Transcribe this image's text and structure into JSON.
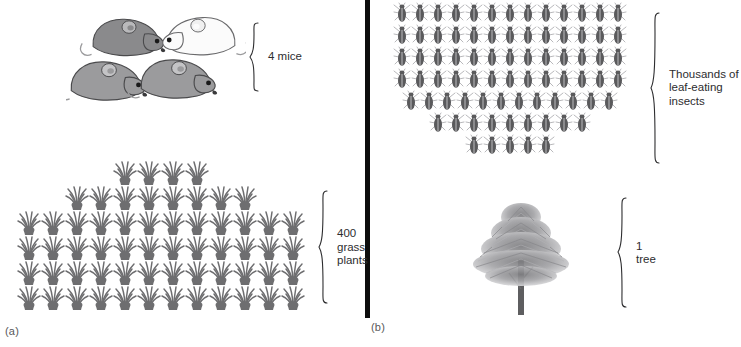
{
  "figure": {
    "panels": [
      {
        "id": "a",
        "caption": "(a)"
      },
      {
        "id": "b",
        "caption": "(b)"
      }
    ]
  },
  "panel_a": {
    "caption": "(a)",
    "levels": [
      {
        "name": "mice",
        "label": "4 mice",
        "count": 4,
        "icon": "mouse-icon",
        "icon_rows": [
          4
        ],
        "colors": [
          "#8c8c8c",
          "#8c8c8c",
          "#f2f2f2",
          "#8c8c8c"
        ]
      },
      {
        "name": "grass-plants",
        "label": "400\ngrass\nplants",
        "count": 400,
        "icon": "grass-tuft-icon",
        "icon_rows": [
          4,
          8,
          12,
          12,
          12,
          12
        ],
        "color": "#6e6e70"
      }
    ]
  },
  "panel_b": {
    "caption": "(b)",
    "levels": [
      {
        "name": "leaf-eating-insects",
        "label": "Thousands of\nleaf-eating\ninsects",
        "count": "Thousands",
        "icon": "beetle-icon",
        "icon_rows": [
          13,
          13,
          13,
          13,
          12,
          9,
          5
        ],
        "color": "#5a5a5c"
      },
      {
        "name": "tree",
        "label": "1\ntree",
        "count": 1,
        "icon": "tree-icon",
        "icon_rows": [
          1
        ],
        "color": "#9a9a9c"
      }
    ]
  },
  "colors": {
    "divider": "#0d0d0d",
    "text": "#2d2d2f",
    "caption": "#58585a",
    "background": "#ffffff",
    "grass": "#6e6e70",
    "insect": "#5a5a5c",
    "mouse_gray": "#8c8c8c",
    "mouse_white": "#f2f2f2",
    "tree": "#9a9a9c"
  }
}
